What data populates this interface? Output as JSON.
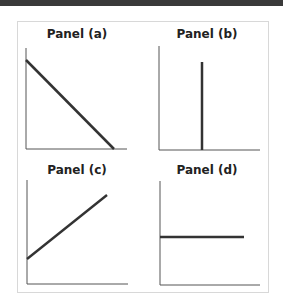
{
  "panels": [
    {
      "title": "Panel (a)",
      "shape": "downward-sloping-line"
    },
    {
      "title": "Panel (b)",
      "shape": "vertical-line"
    },
    {
      "title": "Panel (c)",
      "shape": "upward-sloping-line"
    },
    {
      "title": "Panel (d)",
      "shape": "horizontal-line"
    }
  ],
  "colors": {
    "line": "#333333",
    "axis": "#555555",
    "frame": "#d8d8d8",
    "topbar": "#3a3a3a"
  }
}
